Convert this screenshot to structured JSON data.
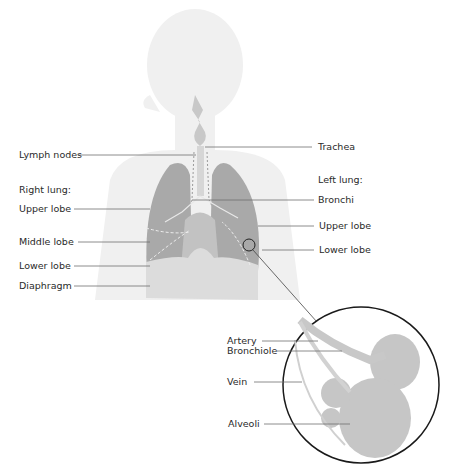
{
  "diagram": {
    "colors": {
      "silhouette": "#efefef",
      "lung": "#a8a8a8",
      "lung_light": "#cfcfcf",
      "diaphragm": "#dcdcdc",
      "leader_line": "#6a6a6a",
      "circle": "#222222",
      "alveoli": "#c4c4c4"
    },
    "left_labels": {
      "lymph_nodes": "Lymph nodes",
      "right_lung_heading": "Right lung:",
      "right_upper_lobe": "Upper lobe",
      "right_middle_lobe": "Middle lobe",
      "right_lower_lobe": "Lower lobe",
      "diaphragm": "Diaphragm"
    },
    "right_labels": {
      "trachea": "Trachea",
      "left_lung_heading": "Left lung:",
      "bronchi": "Bronchi",
      "left_upper_lobe": "Upper lobe",
      "left_lower_lobe": "Lower lobe"
    },
    "inset_labels": {
      "artery": "Artery",
      "bronchiole": "Bronchiole",
      "vein": "Vein",
      "alveoli": "Alveoli"
    }
  }
}
